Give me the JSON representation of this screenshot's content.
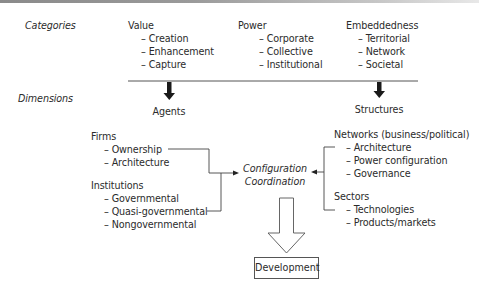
{
  "rows": {
    "categories_label": "Categories",
    "dimensions_label": "Dimensions"
  },
  "categories": [
    {
      "title": "Value",
      "items": [
        "– Creation",
        "– Enhancement",
        "– Capture"
      ]
    },
    {
      "title": "Power",
      "items": [
        "– Corporate",
        "– Collective",
        "– Institutional"
      ]
    },
    {
      "title": "Embeddedness",
      "items": [
        "– Territorial",
        "– Network",
        "– Societal"
      ]
    }
  ],
  "dimensions": {
    "agents": {
      "label": "Agents",
      "groups": [
        {
          "title": "Firms",
          "items": [
            "– Ownership",
            "– Architecture"
          ]
        },
        {
          "title": "Institutions",
          "items": [
            "– Governmental",
            "– Quasi-governmental",
            "– Nongovernmental"
          ]
        }
      ]
    },
    "structures": {
      "label": "Structures",
      "groups": [
        {
          "title": "Networks (business/political)",
          "items": [
            "– Architecture",
            "– Power configuration",
            "– Governance"
          ]
        },
        {
          "title": "Sectors",
          "items": [
            "– Technologies",
            "– Products/markets"
          ]
        }
      ]
    }
  },
  "center": {
    "line1": "Configuration",
    "line2": "Coordination"
  },
  "outcome": {
    "label": "Development"
  },
  "colors": {
    "line": "#444444",
    "text": "#2b2b2b",
    "arrow_fill": "#1a1a1a"
  }
}
